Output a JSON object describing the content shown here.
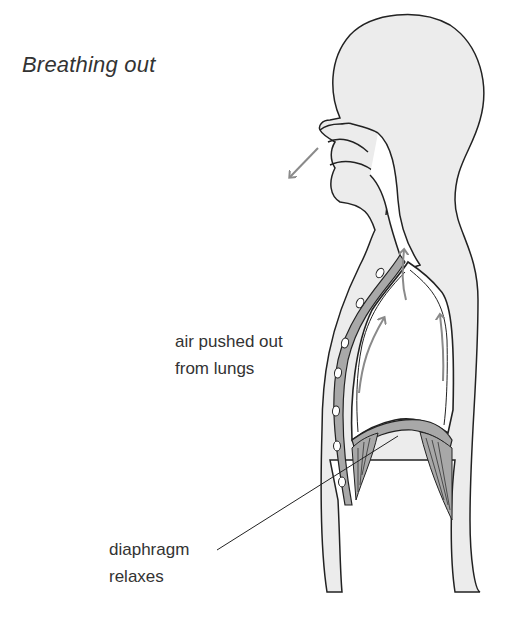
{
  "diagram": {
    "title": "Breathing out",
    "labels": {
      "air": {
        "line1": "air pushed out",
        "line2": "from lungs"
      },
      "diaphragm": {
        "line1": "diaphragm",
        "line2": "relaxes"
      }
    },
    "colors": {
      "body_fill": "#ececec",
      "outline": "#222222",
      "muscle_fill": "#a8a8a8",
      "arrow": "#8a8a8a",
      "lung_fill": "#ffffff"
    },
    "arrows": [
      {
        "name": "exhale-from-mouth",
        "direction": "down-left"
      },
      {
        "name": "trachea-up",
        "direction": "up"
      },
      {
        "name": "lung-left-up",
        "direction": "up"
      },
      {
        "name": "lung-right-up",
        "direction": "up"
      }
    ]
  }
}
